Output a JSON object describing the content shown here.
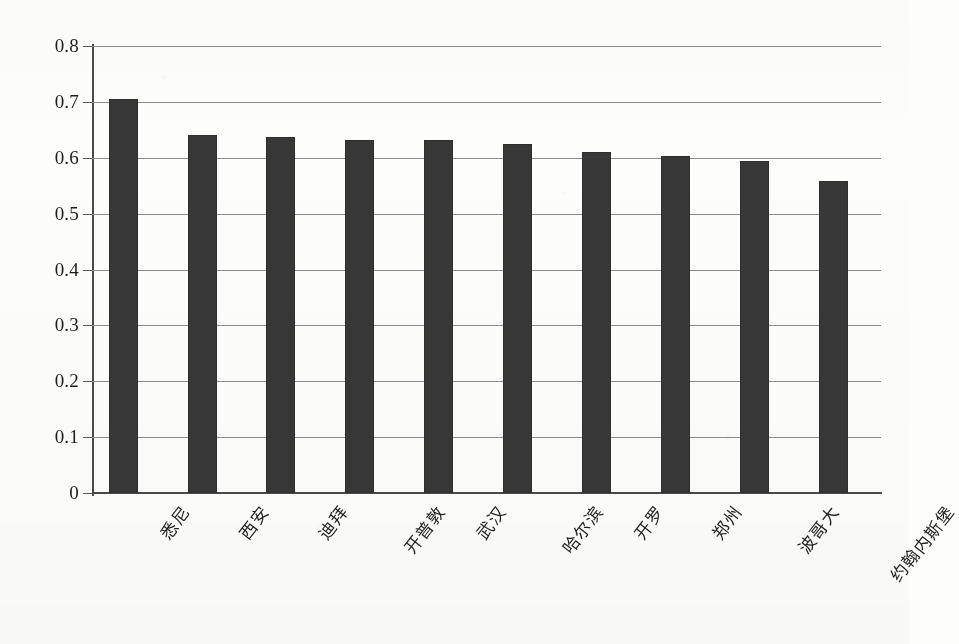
{
  "chart_data": {
    "type": "bar",
    "title": "",
    "subtitle": "",
    "xlabel": "",
    "ylabel": "",
    "categories": [
      "悉尼",
      "西安",
      "迪拜",
      "开普敦",
      "武汉",
      "哈尔滨",
      "开罗",
      "郑州",
      "波哥大",
      "约翰内斯堡"
    ],
    "values": [
      0.705,
      0.641,
      0.638,
      0.632,
      0.631,
      0.624,
      0.611,
      0.604,
      0.595,
      0.558
    ],
    "series": [
      {
        "name": "",
        "values": [
          0.705,
          0.641,
          0.638,
          0.632,
          0.631,
          0.624,
          0.611,
          0.604,
          0.595,
          0.558
        ]
      }
    ],
    "ylim": [
      0,
      0.8
    ],
    "ytick_values": [
      0,
      0.1,
      0.2,
      0.3,
      0.4,
      0.5,
      0.6,
      0.7,
      0.8
    ],
    "ytick_labels": [
      "0",
      "0.1",
      "0.2",
      "0.3",
      "0.4",
      "0.5",
      "0.6",
      "0.7",
      "0.8"
    ],
    "grid": true,
    "grid_axis": "y",
    "legend": false,
    "legend_position": "none",
    "bar_color": "#373737",
    "grid_color": "#8d8d8d",
    "axis_color": "#4a4a4a",
    "background_color": "#fdfdfb",
    "xtick_label_rotation": -52,
    "annotations": []
  }
}
